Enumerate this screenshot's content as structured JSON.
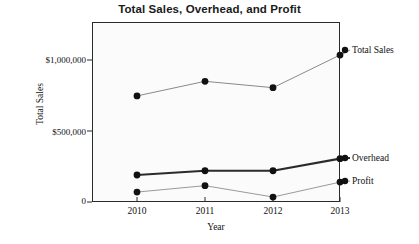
{
  "chart_data": {
    "type": "line",
    "title": "Total Sales, Overhead, and Profit",
    "xlabel": "Year",
    "ylabel": "Total Sales",
    "categories": [
      "2010",
      "2011",
      "2012",
      "2013"
    ],
    "x": [
      2010,
      2011,
      2012,
      2013
    ],
    "ylim": [
      0,
      1200000
    ],
    "yticks": [
      0,
      500000,
      1000000
    ],
    "ytick_labels": [
      "0",
      "$500,000",
      "$1,000,000"
    ],
    "grid": false,
    "legend_position": "right-inline",
    "series": [
      {
        "name": "Total Sales",
        "label": "Total Sales",
        "values": [
          747000,
          850000,
          805000,
          1035000
        ],
        "color": "#8a8a8a",
        "line_width": 1,
        "marker": "filled-circle",
        "marker_color": "#111111"
      },
      {
        "name": "Overhead",
        "label": "Overhead",
        "values": [
          190000,
          220000,
          220000,
          305000
        ],
        "color": "#2b2b2b",
        "line_width": 2.2,
        "marker": "filled-circle",
        "marker_color": "#111111"
      },
      {
        "name": "Profit",
        "label": "Profit",
        "values": [
          70000,
          115000,
          35000,
          140000
        ],
        "color": "#9a9a9a",
        "line_width": 1,
        "marker": "filled-circle",
        "marker_color": "#111111"
      }
    ]
  },
  "axes": {
    "y": {
      "title": "Total Sales",
      "ticks": [
        {
          "label": "$1,000,000",
          "value": 1000000
        },
        {
          "label": "$500,000",
          "value": 500000
        },
        {
          "label": "0",
          "value": 0
        }
      ]
    },
    "x": {
      "title": "Year",
      "ticks": [
        {
          "label": "2010",
          "value": 2010
        },
        {
          "label": "2011",
          "value": 2011
        },
        {
          "label": "2012",
          "value": 2012
        },
        {
          "label": "2013",
          "value": 2013
        }
      ]
    }
  },
  "colors": {
    "page_background": "#ffffff",
    "plot_background": "#fbfbfb",
    "axis": "#2a2a2a",
    "text": "#111111",
    "total_sales_line": "#8a8a8a",
    "overhead_line": "#2b2b2b",
    "profit_line": "#9a9a9a",
    "marker": "#111111"
  }
}
